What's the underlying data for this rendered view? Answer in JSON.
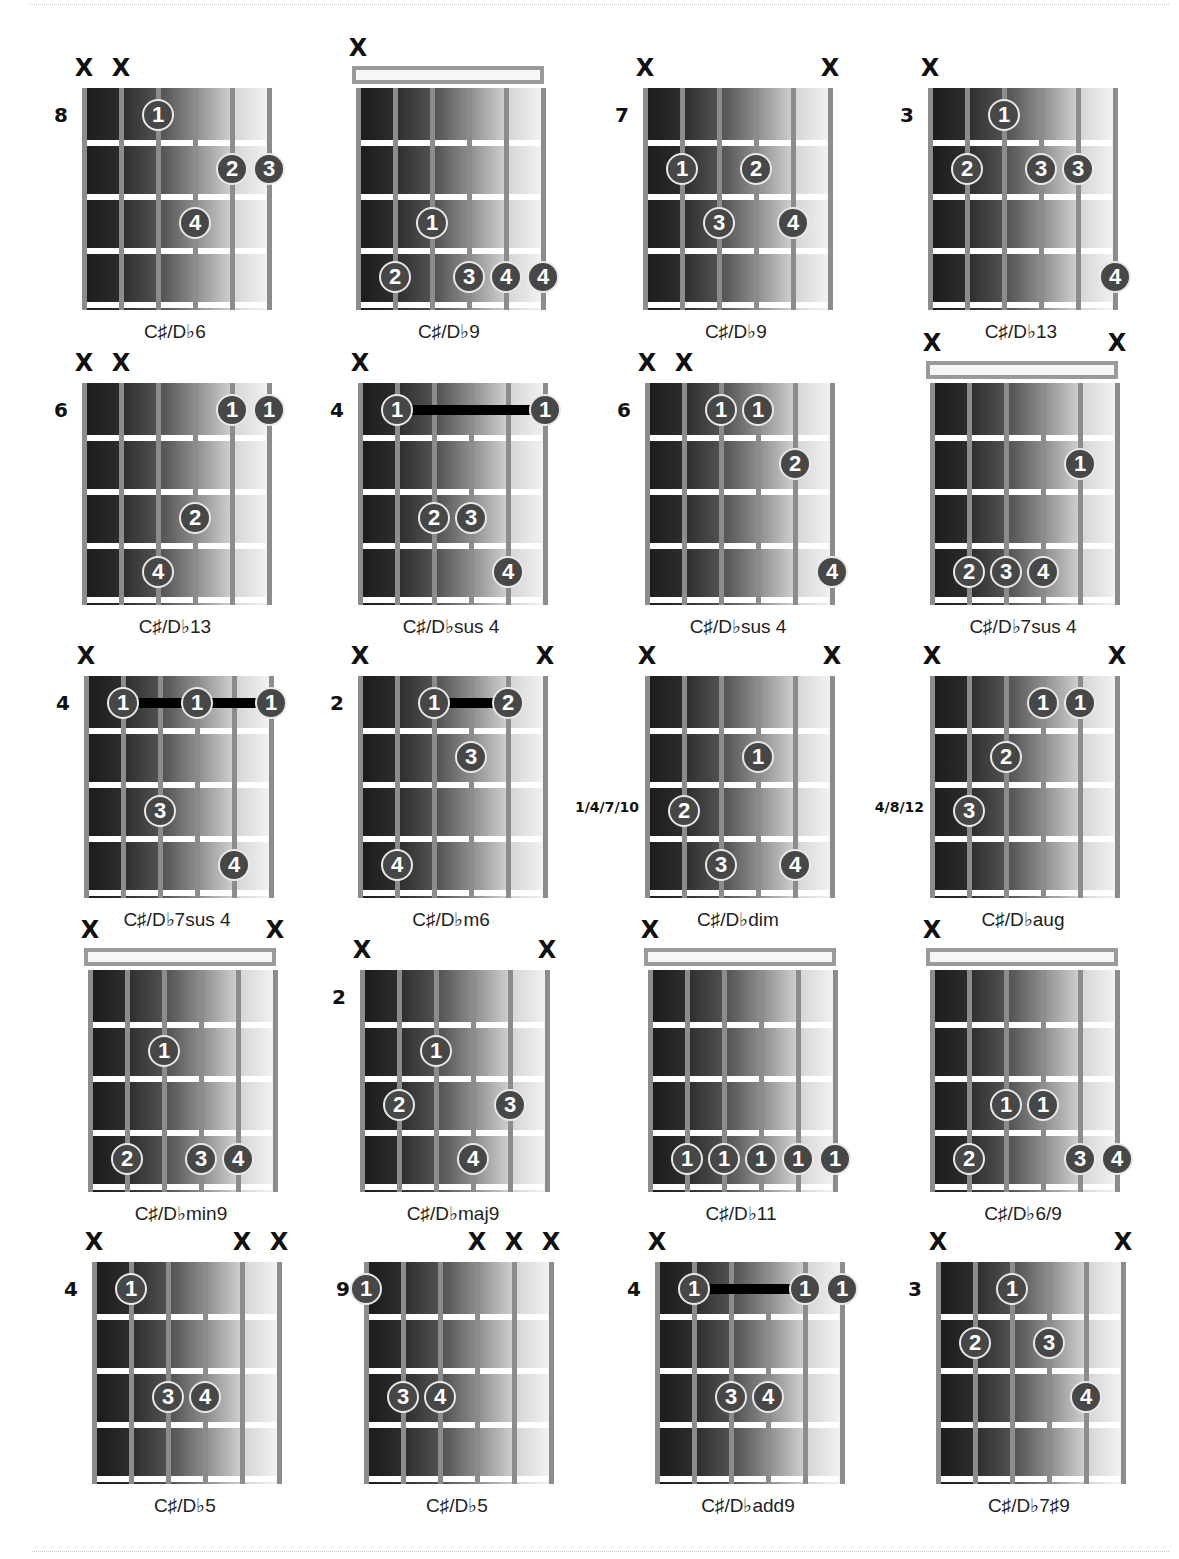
{
  "page": {
    "colors": {
      "dot_fill": "#474747",
      "dot_ring": "#e8e8e8",
      "string": "#8c8c8c",
      "fret": "#ffffff",
      "barre": "#000000"
    }
  },
  "chart_data": {
    "type": "table",
    "note": "strings numbered 1 (low E, left) to 6 (high E, right); fret rows 1-4 relative to position",
    "chords": [
      {
        "name": "C♯/D♭6",
        "position": "8",
        "nut": false,
        "muted": [
          1,
          2
        ],
        "dots": [
          {
            "s": 3,
            "f": 1,
            "n": "1"
          },
          {
            "s": 5,
            "f": 2,
            "n": "2"
          },
          {
            "s": 6,
            "f": 2,
            "n": "3"
          },
          {
            "s": 4,
            "f": 3,
            "n": "4"
          }
        ],
        "barres": []
      },
      {
        "name": "C♯/D♭9",
        "position": "",
        "nut": true,
        "muted": [
          1
        ],
        "dots": [
          {
            "s": 3,
            "f": 3,
            "n": "1"
          },
          {
            "s": 2,
            "f": 4,
            "n": "2"
          },
          {
            "s": 4,
            "f": 4,
            "n": "3"
          },
          {
            "s": 5,
            "f": 4,
            "n": "4"
          },
          {
            "s": 6,
            "f": 4,
            "n": "4"
          }
        ],
        "barres": []
      },
      {
        "name": "C♯/D♭9",
        "position": "7",
        "nut": false,
        "muted": [
          1,
          6
        ],
        "dots": [
          {
            "s": 2,
            "f": 2,
            "n": "1"
          },
          {
            "s": 4,
            "f": 2,
            "n": "2"
          },
          {
            "s": 3,
            "f": 3,
            "n": "3"
          },
          {
            "s": 5,
            "f": 3,
            "n": "4"
          }
        ],
        "barres": []
      },
      {
        "name": "C♯/D♭13",
        "position": "3",
        "nut": false,
        "muted": [
          1
        ],
        "dots": [
          {
            "s": 3,
            "f": 1,
            "n": "1"
          },
          {
            "s": 2,
            "f": 2,
            "n": "2"
          },
          {
            "s": 4,
            "f": 2,
            "n": "3"
          },
          {
            "s": 5,
            "f": 2,
            "n": "3"
          },
          {
            "s": 6,
            "f": 4,
            "n": "4"
          }
        ],
        "barres": []
      },
      {
        "name": "C♯/D♭13",
        "position": "6",
        "nut": false,
        "muted": [
          1,
          2
        ],
        "dots": [
          {
            "s": 5,
            "f": 1,
            "n": "1"
          },
          {
            "s": 6,
            "f": 1,
            "n": "1"
          },
          {
            "s": 4,
            "f": 3,
            "n": "2"
          },
          {
            "s": 3,
            "f": 4,
            "n": "4"
          }
        ],
        "barres": []
      },
      {
        "name": "C♯/D♭sus 4",
        "position": "4",
        "nut": false,
        "muted": [
          1
        ],
        "dots": [
          {
            "s": 2,
            "f": 1,
            "n": "1"
          },
          {
            "s": 6,
            "f": 1,
            "n": "1"
          },
          {
            "s": 3,
            "f": 3,
            "n": "2"
          },
          {
            "s": 4,
            "f": 3,
            "n": "3"
          },
          {
            "s": 5,
            "f": 4,
            "n": "4"
          }
        ],
        "barres": [
          {
            "f": 1,
            "from": 2,
            "to": 6
          }
        ]
      },
      {
        "name": "C♯/D♭sus 4",
        "position": "6",
        "nut": false,
        "muted": [
          1,
          2
        ],
        "dots": [
          {
            "s": 3,
            "f": 1,
            "n": "1"
          },
          {
            "s": 4,
            "f": 1,
            "n": "1"
          },
          {
            "s": 5,
            "f": 2,
            "n": "2"
          },
          {
            "s": 6,
            "f": 4,
            "n": "4"
          }
        ],
        "barres": []
      },
      {
        "name": "C♯/D♭7sus 4",
        "position": "",
        "nut": true,
        "muted": [
          1,
          6
        ],
        "dots": [
          {
            "s": 5,
            "f": 2,
            "n": "1"
          },
          {
            "s": 2,
            "f": 4,
            "n": "2"
          },
          {
            "s": 3,
            "f": 4,
            "n": "3"
          },
          {
            "s": 4,
            "f": 4,
            "n": "4"
          }
        ],
        "barres": []
      },
      {
        "name": "C♯/D♭7sus 4",
        "position": "4",
        "nut": false,
        "muted": [
          1
        ],
        "dots": [
          {
            "s": 2,
            "f": 1,
            "n": "1"
          },
          {
            "s": 4,
            "f": 1,
            "n": "1"
          },
          {
            "s": 6,
            "f": 1,
            "n": "1"
          },
          {
            "s": 3,
            "f": 3,
            "n": "3"
          },
          {
            "s": 5,
            "f": 4,
            "n": "4"
          }
        ],
        "barres": [
          {
            "f": 1,
            "from": 2,
            "to": 6
          }
        ]
      },
      {
        "name": "C♯/D♭m6",
        "position": "2",
        "nut": false,
        "muted": [
          1,
          6
        ],
        "dots": [
          {
            "s": 3,
            "f": 1,
            "n": "1"
          },
          {
            "s": 5,
            "f": 1,
            "n": "2"
          },
          {
            "s": 4,
            "f": 2,
            "n": "3"
          },
          {
            "s": 2,
            "f": 4,
            "n": "4"
          }
        ],
        "barres": [
          {
            "f": 1,
            "from": 3,
            "to": 5
          }
        ]
      },
      {
        "name": "C♯/D♭dim",
        "position": "1/4/7/10",
        "nut": false,
        "muted": [
          1,
          6
        ],
        "dots": [
          {
            "s": 4,
            "f": 2,
            "n": "1"
          },
          {
            "s": 2,
            "f": 3,
            "n": "2"
          },
          {
            "s": 3,
            "f": 4,
            "n": "3"
          },
          {
            "s": 5,
            "f": 4,
            "n": "4"
          }
        ],
        "barres": []
      },
      {
        "name": "C♯/D♭aug",
        "position": "4/8/12",
        "nut": false,
        "muted": [
          1,
          6
        ],
        "dots": [
          {
            "s": 4,
            "f": 1,
            "n": "1"
          },
          {
            "s": 5,
            "f": 1,
            "n": "1"
          },
          {
            "s": 3,
            "f": 2,
            "n": "2"
          },
          {
            "s": 2,
            "f": 3,
            "n": "3"
          }
        ],
        "barres": []
      },
      {
        "name": "C♯/D♭min9",
        "position": "",
        "nut": true,
        "muted": [
          1,
          6
        ],
        "dots": [
          {
            "s": 3,
            "f": 2,
            "n": "1"
          },
          {
            "s": 2,
            "f": 4,
            "n": "2"
          },
          {
            "s": 4,
            "f": 4,
            "n": "3"
          },
          {
            "s": 5,
            "f": 4,
            "n": "4"
          }
        ],
        "barres": []
      },
      {
        "name": "C♯/D♭maj9",
        "position": "2",
        "nut": false,
        "muted": [
          1,
          6
        ],
        "dots": [
          {
            "s": 3,
            "f": 2,
            "n": "1"
          },
          {
            "s": 2,
            "f": 3,
            "n": "2"
          },
          {
            "s": 5,
            "f": 3,
            "n": "3"
          },
          {
            "s": 4,
            "f": 4,
            "n": "4"
          }
        ],
        "barres": []
      },
      {
        "name": "C♯/D♭11",
        "position": "",
        "nut": true,
        "muted": [
          1
        ],
        "dots": [
          {
            "s": 2,
            "f": 4,
            "n": "1"
          },
          {
            "s": 3,
            "f": 4,
            "n": "1"
          },
          {
            "s": 4,
            "f": 4,
            "n": "1"
          },
          {
            "s": 5,
            "f": 4,
            "n": "1"
          },
          {
            "s": 6,
            "f": 4,
            "n": "1"
          }
        ],
        "barres": []
      },
      {
        "name": "C♯/D♭6/9",
        "position": "",
        "nut": true,
        "muted": [
          1
        ],
        "dots": [
          {
            "s": 3,
            "f": 3,
            "n": "1"
          },
          {
            "s": 4,
            "f": 3,
            "n": "1"
          },
          {
            "s": 2,
            "f": 4,
            "n": "2"
          },
          {
            "s": 5,
            "f": 4,
            "n": "3"
          },
          {
            "s": 6,
            "f": 4,
            "n": "4"
          }
        ],
        "barres": []
      },
      {
        "name": "C♯/D♭5",
        "position": "4",
        "nut": false,
        "muted": [
          1,
          5,
          6
        ],
        "dots": [
          {
            "s": 2,
            "f": 1,
            "n": "1"
          },
          {
            "s": 3,
            "f": 3,
            "n": "3"
          },
          {
            "s": 4,
            "f": 3,
            "n": "4"
          }
        ],
        "barres": []
      },
      {
        "name": "C♯/D♭5",
        "position": "9",
        "nut": false,
        "muted": [
          4,
          5,
          6
        ],
        "dots": [
          {
            "s": 1,
            "f": 1,
            "n": "1"
          },
          {
            "s": 2,
            "f": 3,
            "n": "3"
          },
          {
            "s": 3,
            "f": 3,
            "n": "4"
          }
        ],
        "barres": []
      },
      {
        "name": "C♯/D♭add9",
        "position": "4",
        "nut": false,
        "muted": [
          1
        ],
        "dots": [
          {
            "s": 2,
            "f": 1,
            "n": "1"
          },
          {
            "s": 5,
            "f": 1,
            "n": "1"
          },
          {
            "s": 6,
            "f": 1,
            "n": "1"
          },
          {
            "s": 3,
            "f": 3,
            "n": "3"
          },
          {
            "s": 4,
            "f": 3,
            "n": "4"
          }
        ],
        "barres": [
          {
            "f": 1,
            "from": 2,
            "to": 5
          }
        ]
      },
      {
        "name": "C♯/D♭7♯9",
        "position": "3",
        "nut": false,
        "muted": [
          1,
          6
        ],
        "dots": [
          {
            "s": 3,
            "f": 1,
            "n": "1"
          },
          {
            "s": 2,
            "f": 2,
            "n": "2"
          },
          {
            "s": 4,
            "f": 2,
            "n": "3"
          },
          {
            "s": 5,
            "f": 3,
            "n": "4"
          }
        ],
        "barres": []
      }
    ]
  },
  "labels": {
    "mute_symbol": "X"
  }
}
